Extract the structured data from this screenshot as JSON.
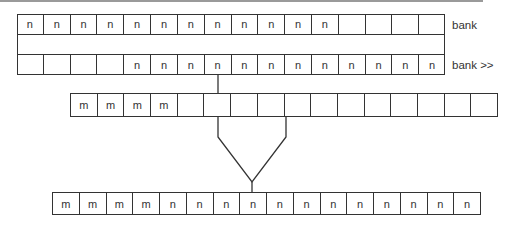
{
  "diagram": {
    "bank_row": {
      "label": "bank",
      "cells": [
        "n",
        "n",
        "n",
        "n",
        "n",
        "n",
        "n",
        "n",
        "n",
        "n",
        "n",
        "n",
        "",
        "",
        "",
        ""
      ]
    },
    "shifted_row": {
      "label": "bank >>",
      "cells": [
        "",
        "",
        "",
        "",
        "n",
        "n",
        "n",
        "n",
        "n",
        "n",
        "n",
        "n",
        "n",
        "n",
        "n",
        "n"
      ]
    },
    "m_row": {
      "cells": [
        "m",
        "m",
        "m",
        "m",
        "",
        "",
        "",
        "",
        "",
        "",
        "",
        "",
        "",
        "",
        "",
        ""
      ]
    },
    "result_row": {
      "cells": [
        "m",
        "m",
        "m",
        "m",
        "n",
        "n",
        "n",
        "n",
        "n",
        "n",
        "n",
        "n",
        "n",
        "n",
        "n",
        "n"
      ]
    },
    "colors": {
      "stroke": "#333333",
      "rule": "#9a9a9a"
    }
  }
}
